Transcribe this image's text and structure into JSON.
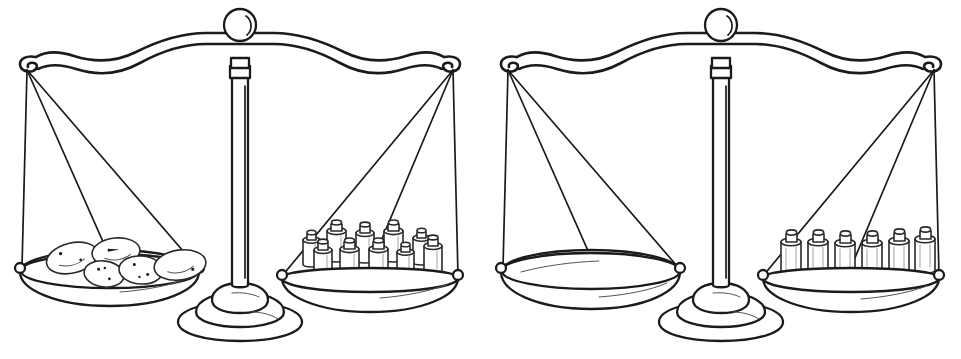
{
  "page": {
    "background_color": "#ffffff",
    "ink_color": "#1b1b1b",
    "width": 961,
    "height": 359,
    "style": "black-and-white line drawing / coloring-book outline"
  },
  "scales": [
    {
      "id": "scale-left",
      "name": "left-balance-scale",
      "state": "balanced",
      "beam_tilt_degrees": 0,
      "left_pan": {
        "name": "potato-pan",
        "contents_label": "potatoes",
        "item_count": 5,
        "item_shape": "oval-potato",
        "items": [
          {
            "cx": 72,
            "cy": 258,
            "rx": 26,
            "ry": 15,
            "rot": -14,
            "spots": 3
          },
          {
            "cx": 116,
            "cy": 252,
            "rx": 24,
            "ry": 14,
            "rot": -6,
            "spots": 2
          },
          {
            "cx": 104,
            "cy": 274,
            "rx": 20,
            "ry": 13,
            "rot": 8,
            "spots": 3
          },
          {
            "cx": 141,
            "cy": 270,
            "rx": 22,
            "ry": 14,
            "rot": 4,
            "spots": 3
          },
          {
            "cx": 180,
            "cy": 265,
            "rx": 26,
            "ry": 15,
            "rot": -8,
            "spots": 2
          }
        ]
      },
      "right_pan": {
        "name": "weights-pan",
        "contents_label": "cylindrical calibration weights",
        "item_count": 10,
        "item_shape": "cylinder-weight-with-knob",
        "rows": 2,
        "back_row_count": 5,
        "front_row_count": 5,
        "items": [
          {
            "x": 303,
            "y": 232,
            "w": 17,
            "h": 32,
            "row": "back"
          },
          {
            "x": 327,
            "y": 224,
            "w": 19,
            "h": 36,
            "row": "back"
          },
          {
            "x": 356,
            "y": 226,
            "w": 18,
            "h": 35,
            "row": "back"
          },
          {
            "x": 384,
            "y": 224,
            "w": 19,
            "h": 36,
            "row": "back"
          },
          {
            "x": 413,
            "y": 230,
            "w": 17,
            "h": 33,
            "row": "back"
          },
          {
            "x": 314,
            "y": 243,
            "w": 18,
            "h": 33,
            "row": "front"
          },
          {
            "x": 340,
            "y": 242,
            "w": 19,
            "h": 34,
            "row": "front"
          },
          {
            "x": 369,
            "y": 242,
            "w": 19,
            "h": 34,
            "row": "front"
          },
          {
            "x": 397,
            "y": 244,
            "w": 17,
            "h": 32,
            "row": "front"
          },
          {
            "x": 424,
            "y": 238,
            "w": 18,
            "h": 33,
            "row": "front"
          }
        ]
      }
    },
    {
      "id": "scale-right",
      "name": "right-balance-scale",
      "state": "balanced",
      "beam_tilt_degrees": 0,
      "left_pan": {
        "name": "empty-pan",
        "contents_label": "empty",
        "item_count": 0,
        "item_shape": null,
        "items": []
      },
      "right_pan": {
        "name": "weights-pan",
        "contents_label": "cylindrical calibration weights",
        "item_count": 6,
        "item_shape": "cylinder-weight-with-knob",
        "rows": 1,
        "back_row_count": 6,
        "front_row_count": 0,
        "items": [
          {
            "x": 300,
            "y": 235,
            "w": 20,
            "h": 36,
            "row": "back"
          },
          {
            "x": 327,
            "y": 235,
            "w": 20,
            "h": 36,
            "row": "back"
          },
          {
            "x": 354,
            "y": 236,
            "w": 20,
            "h": 36,
            "row": "back"
          },
          {
            "x": 381,
            "y": 236,
            "w": 20,
            "h": 36,
            "row": "back"
          },
          {
            "x": 408,
            "y": 234,
            "w": 20,
            "h": 36,
            "row": "back"
          },
          {
            "x": 434,
            "y": 232,
            "w": 20,
            "h": 36,
            "row": "back"
          }
        ]
      }
    }
  ],
  "parts": {
    "finial_knob": "round-knob-with-crescent-highlight",
    "beam": "wavy-horizontal-beam-with-end-hooks",
    "column": "vertical-tapered-post",
    "base": "flared-dome-pedestal-base",
    "pan": "shallow-elliptical-bowl",
    "strings": "three-suspension-cords-per-pan"
  }
}
